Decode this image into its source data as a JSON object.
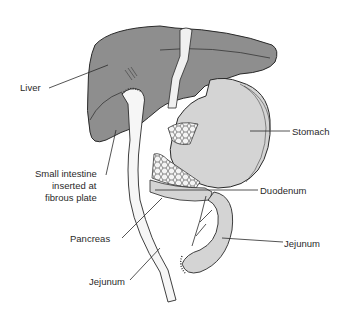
{
  "figure": {
    "type": "anatomical illustration",
    "colors": {
      "liver": "#8e8e8e",
      "stomach": "#d4d4d4",
      "intestine": "#e6e6e6",
      "pancreas_pattern": "#f2f2f2",
      "outline": "#2a2a2a",
      "background": "#ffffff"
    }
  },
  "labels": {
    "liver": "Liver",
    "stomach": "Stomach",
    "small_intestine_line1": "Small intestine",
    "small_intestine_line2": "inserted at",
    "small_intestine_line3": "fibrous plate",
    "duodenum": "Duodenum",
    "pancreas": "Pancreas",
    "jejunum_right": "Jejunum",
    "jejunum_bottom": "Jejunum"
  }
}
